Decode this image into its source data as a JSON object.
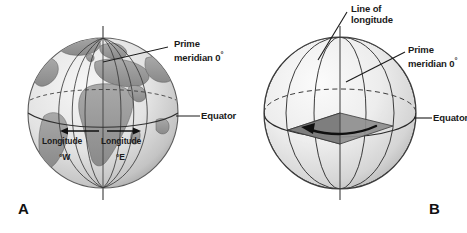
{
  "figure": {
    "background_color": "#ffffff",
    "width": 467,
    "height": 233
  },
  "panels": [
    {
      "id": "A",
      "letter": "A",
      "subject": "earth-globe-with-continents",
      "description": "Shaded relief globe showing Africa, Europe and South America with meridian lines, equator and polar axis",
      "labels": {
        "prime_meridian": {
          "line1": "Prime",
          "line2": "meridian 0",
          "degree": "°"
        },
        "equator": "Equator",
        "longitude_west": {
          "line1": "Longitude",
          "line2": "°W"
        },
        "longitude_east": {
          "line1": "Longitude",
          "line2": "°E"
        }
      },
      "colors": {
        "ocean": "#e9e9e9",
        "land": "#9b9b9b",
        "grid_line": "#3c3c3c",
        "outline": "#4a4a4a",
        "axis": "#6e6e6e"
      }
    },
    {
      "id": "B",
      "letter": "B",
      "subject": "schematic-sphere-with-longitude-wedge",
      "description": "Plain shaded sphere showing lines of longitude, the equator, the prime meridian and a shaded angular wedge with a curved arrow at the centre",
      "labels": {
        "line_of_longitude": {
          "line1": "Line of",
          "line2": "longitude"
        },
        "prime_meridian": {
          "line1": "Prime",
          "line2": "meridian 0",
          "degree": "°"
        },
        "equator": "Equator"
      },
      "colors": {
        "sphere_light": "#f2f2f2",
        "sphere_shade": "#c8c8c8",
        "wedge": "#8f8f8f",
        "grid_line": "#3c3c3c",
        "outline": "#3c3c3c",
        "arrow": "#111111"
      }
    }
  ]
}
